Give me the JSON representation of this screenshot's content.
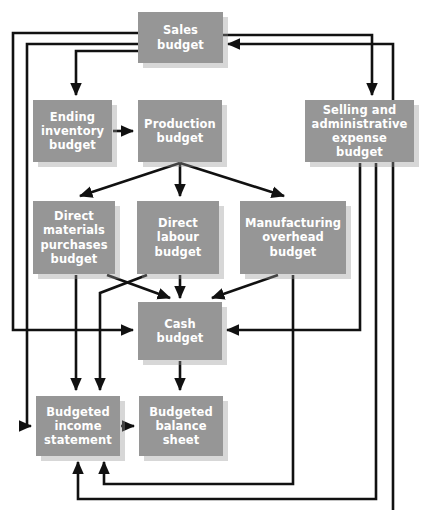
{
  "diagram": {
    "type": "flowchart",
    "style": {
      "node_fill": "#969696",
      "node_text": "#ffffff",
      "connector_color": "#111111",
      "background": "#ffffff",
      "shadow": "#c9c9c9"
    },
    "nodes": [
      {
        "id": "sales-budget",
        "label": "Sales\nbudget",
        "x": 138,
        "y": 12,
        "w": 85,
        "h": 51
      },
      {
        "id": "ending-inventory-budget",
        "label": "Ending\ninventory\nbudget",
        "x": 33,
        "y": 100,
        "w": 79,
        "h": 62
      },
      {
        "id": "production-budget",
        "label": "Production\nbudget",
        "x": 138,
        "y": 100,
        "w": 84,
        "h": 62
      },
      {
        "id": "selling-and-administrative-expense-budget",
        "label": "Selling and\nadministrative\nexpense budget",
        "x": 305,
        "y": 100,
        "w": 109,
        "h": 62
      },
      {
        "id": "direct-materials-purchases-budget",
        "label": "Direct\nmaterials\npurchases\nbudget",
        "x": 33,
        "y": 201,
        "w": 82,
        "h": 73
      },
      {
        "id": "direct-labour-budget",
        "label": "Direct\nlabour\nbudget",
        "x": 137,
        "y": 201,
        "w": 82,
        "h": 73
      },
      {
        "id": "manufacturing-overhead-budget",
        "label": "Manufacturing\noverhead\nbudget",
        "x": 240,
        "y": 201,
        "w": 106,
        "h": 73
      },
      {
        "id": "cash-budget",
        "label": "Cash\nbudget",
        "x": 138,
        "y": 302,
        "w": 84,
        "h": 58
      },
      {
        "id": "budgeted-income-statement",
        "label": "Budgeted\nincome\nstatement",
        "x": 36,
        "y": 396,
        "w": 84,
        "h": 60
      },
      {
        "id": "budgeted-balance-sheet",
        "label": "Budgeted\nbalance\nsheet",
        "x": 139,
        "y": 396,
        "w": 84,
        "h": 60
      }
    ],
    "edges": [
      {
        "id": "sales-to-ending-inventory",
        "from": "sales-budget",
        "to": "ending-inventory-budget"
      },
      {
        "id": "sales-to-selling-admin",
        "from": "sales-budget",
        "to": "selling-and-administrative-expense-budget"
      },
      {
        "id": "sales-to-cash",
        "from": "sales-budget",
        "to": "cash-budget"
      },
      {
        "id": "sales-to-budgeted-income-statement",
        "from": "sales-budget",
        "to": "budgeted-income-statement"
      },
      {
        "id": "ending-inventory-to-production",
        "from": "ending-inventory-budget",
        "to": "production-budget"
      },
      {
        "id": "production-to-direct-materials",
        "from": "production-budget",
        "to": "direct-materials-purchases-budget"
      },
      {
        "id": "production-to-direct-labour",
        "from": "production-budget",
        "to": "direct-labour-budget"
      },
      {
        "id": "production-to-manufacturing-overhead",
        "from": "production-budget",
        "to": "manufacturing-overhead-budget"
      },
      {
        "id": "direct-materials-to-cash",
        "from": "direct-materials-purchases-budget",
        "to": "cash-budget"
      },
      {
        "id": "direct-labour-to-cash",
        "from": "direct-labour-budget",
        "to": "cash-budget"
      },
      {
        "id": "manufacturing-overhead-to-cash",
        "from": "manufacturing-overhead-budget",
        "to": "cash-budget"
      },
      {
        "id": "direct-materials-to-budgeted-income-statement",
        "from": "direct-materials-purchases-budget",
        "to": "budgeted-income-statement"
      },
      {
        "id": "direct-labour-to-budgeted-income-statement",
        "from": "direct-labour-budget",
        "to": "budgeted-income-statement"
      },
      {
        "id": "manufacturing-overhead-to-budgeted-income-statement",
        "from": "manufacturing-overhead-budget",
        "to": "budgeted-income-statement"
      },
      {
        "id": "selling-admin-to-cash",
        "from": "selling-and-administrative-expense-budget",
        "to": "cash-budget"
      },
      {
        "id": "selling-admin-to-budgeted-income-statement",
        "from": "selling-and-administrative-expense-budget",
        "to": "budgeted-income-statement"
      },
      {
        "id": "cash-to-budgeted-balance-sheet",
        "from": "cash-budget",
        "to": "budgeted-balance-sheet"
      },
      {
        "id": "budgeted-income-statement-to-budgeted-balance-sheet",
        "from": "budgeted-income-statement",
        "to": "budgeted-balance-sheet"
      },
      {
        "id": "feedback-to-sales",
        "from": "budgeted-balance-sheet",
        "to": "sales-budget"
      }
    ]
  }
}
